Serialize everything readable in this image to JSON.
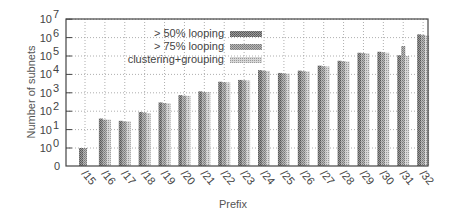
{
  "chart_data": {
    "type": "bar",
    "title": "",
    "xlabel": "Prefix",
    "ylabel": "Number of subnets",
    "yscale": "log",
    "ylim": [
      0,
      10000000
    ],
    "y_ticks": [
      "0",
      "10^0",
      "10^1",
      "10^2",
      "10^3",
      "10^4",
      "10^5",
      "10^6",
      "10^7"
    ],
    "grid": true,
    "legend_position": "upper-left-inside",
    "categories": [
      "/15",
      "/16",
      "/17",
      "/18",
      "/19",
      "/20",
      "/21",
      "/22",
      "/23",
      "/24",
      "/25",
      "/26",
      "/27",
      "/28",
      "/29",
      "/30",
      "/31",
      "/32"
    ],
    "series": [
      {
        "name": "> 50% looping",
        "values": [
          1,
          40,
          30,
          90,
          300,
          750,
          1200,
          4000,
          5000,
          17000,
          12000,
          16000,
          30000,
          55000,
          150000,
          170000,
          110000,
          1500000
        ]
      },
      {
        "name": "> 75% looping",
        "values": [
          1,
          35,
          28,
          85,
          280,
          700,
          1100,
          3800,
          4800,
          16000,
          11500,
          15000,
          28000,
          52000,
          145000,
          160000,
          350000,
          1400000
        ]
      },
      {
        "name": "clustering+grouping",
        "values": [
          0,
          35,
          28,
          80,
          270,
          680,
          1100,
          3700,
          4700,
          15500,
          11000,
          14500,
          27000,
          50000,
          140000,
          150000,
          100000,
          1300000
        ]
      }
    ]
  },
  "axis": {
    "xlabel": "Prefix",
    "ylabel": "Number of subnets",
    "y_tick_labels": [
      {
        "base": "0",
        "exp": ""
      },
      {
        "base": "10",
        "exp": "0"
      },
      {
        "base": "10",
        "exp": "1"
      },
      {
        "base": "10",
        "exp": "2"
      },
      {
        "base": "10",
        "exp": "3"
      },
      {
        "base": "10",
        "exp": "4"
      },
      {
        "base": "10",
        "exp": "5"
      },
      {
        "base": "10",
        "exp": "6"
      },
      {
        "base": "10",
        "exp": "7"
      }
    ]
  },
  "legend": {
    "items": [
      "> 50% looping",
      "> 75% looping",
      "clustering+grouping"
    ]
  },
  "colors": {
    "series1": "#8a8a8a",
    "series2": "#a8a8a8",
    "series3": "#c4c4c4",
    "axis": "#444444",
    "grid": "#aaaaaa"
  }
}
